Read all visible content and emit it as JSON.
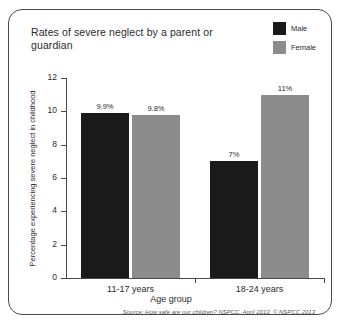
{
  "chart_data": {
    "type": "bar",
    "title": "Rates of severe neglect by a parent or guardian",
    "xlabel": "Age group",
    "ylabel": "Percentage experiencing severe neglect in childhood",
    "categories": [
      "11-17 years",
      "18-24 years"
    ],
    "series": [
      {
        "name": "Male",
        "color": "#1a1a1a",
        "values": [
          9.9,
          7
        ],
        "labels": [
          "9.9%",
          "7%"
        ]
      },
      {
        "name": "Female",
        "color": "#8c8c8c",
        "values": [
          9.8,
          11
        ],
        "labels": [
          "9.8%",
          "11%"
        ]
      }
    ],
    "ylim": [
      0,
      12
    ],
    "yticks": [
      0,
      2,
      4,
      6,
      8,
      10,
      12
    ],
    "ytick_labels": [
      "0",
      "2",
      "4",
      "6",
      "8",
      "10",
      "12"
    ],
    "grid": false,
    "legend_position": "top-right"
  },
  "source": "Source: How safe are our children? NSPCC, April 2013. © NSPCC 2013"
}
